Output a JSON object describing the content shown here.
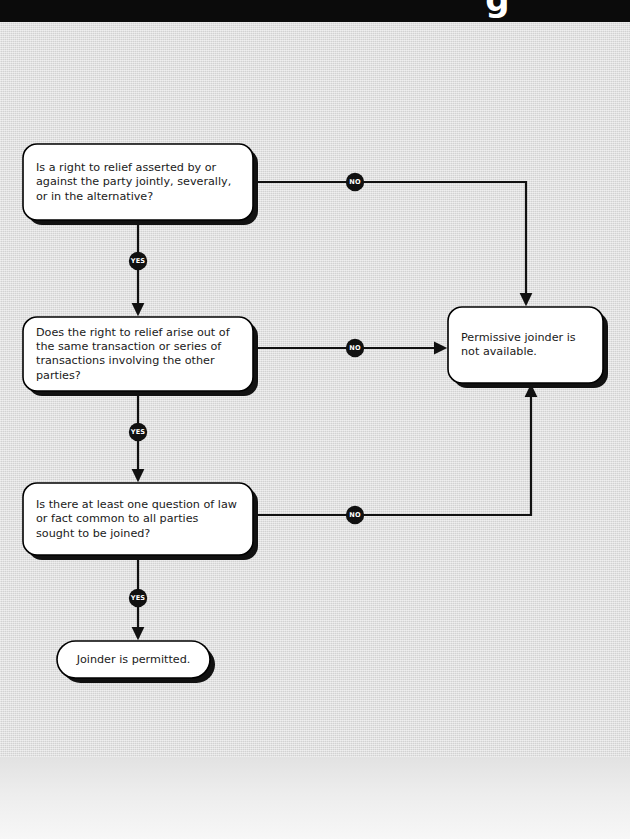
{
  "header": {
    "title": "g",
    "bar_color": "#0b0b0b"
  },
  "page": {
    "background_color": "#dcdcdc",
    "ink_color": "#111111",
    "node_fill": "#ffffff"
  },
  "chart_data": {
    "type": "diagram",
    "nodes": [
      {
        "id": "q1",
        "kind": "decision",
        "lines": [
          "Is a right to relief asserted by or",
          "against the party jointly, severally,",
          "or in the alternative?"
        ],
        "x": 23,
        "y": 144,
        "w": 230,
        "h": 76
      },
      {
        "id": "q2",
        "kind": "decision",
        "lines": [
          "Does the right to relief arise out of",
          "the same transaction or series of",
          "transactions involving the other",
          "parties?"
        ],
        "x": 23,
        "y": 317,
        "w": 230,
        "h": 74
      },
      {
        "id": "q3",
        "kind": "decision",
        "lines": [
          "Is there at least one question of law",
          "or fact common to all parties",
          "sought to be joined?"
        ],
        "x": 23,
        "y": 483,
        "w": 230,
        "h": 72
      },
      {
        "id": "yes-end",
        "kind": "terminal",
        "lines": [
          "Joinder is permitted."
        ],
        "x": 57,
        "y": 641,
        "w": 153,
        "h": 37
      },
      {
        "id": "no-end",
        "kind": "terminal",
        "lines": [
          "Permissive joinder is",
          "not available."
        ],
        "x": 448,
        "y": 307,
        "w": 155,
        "h": 76
      }
    ],
    "edges": [
      {
        "id": "e1",
        "from": "q1",
        "to": "q2",
        "label": "YES",
        "label_x": 138,
        "label_y": 261
      },
      {
        "id": "e2",
        "from": "q2",
        "to": "q3",
        "label": "YES",
        "label_x": 138,
        "label_y": 432
      },
      {
        "id": "e3",
        "from": "q3",
        "to": "yes-end",
        "label": "YES",
        "label_x": 138,
        "label_y": 598
      },
      {
        "id": "e4",
        "from": "q1",
        "to": "no-end",
        "label": "NO",
        "label_x": 355,
        "label_y": 182
      },
      {
        "id": "e5",
        "from": "q2",
        "to": "no-end",
        "label": "NO",
        "label_x": 355,
        "label_y": 348
      },
      {
        "id": "e6",
        "from": "q3",
        "to": "no-end",
        "label": "NO",
        "label_x": 355,
        "label_y": 515
      }
    ],
    "labels": {
      "yes": "YES",
      "no": "NO"
    }
  }
}
